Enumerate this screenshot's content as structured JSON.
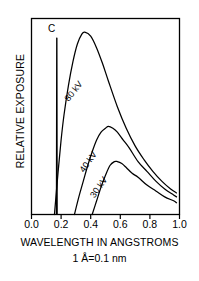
{
  "chart_data": {
    "type": "line",
    "title": "",
    "xlabel": "WAVELENGTH IN ANGSTROMS",
    "xsublabel": "1 Å=0.1 nm",
    "ylabel": "RELATIVE EXPOSURE",
    "xlim": [
      0.0,
      1.0
    ],
    "ylim": [
      0,
      100
    ],
    "grid": false,
    "legend_position": "inline-curve-labels",
    "xticks": [
      0.0,
      0.2,
      0.4,
      0.6,
      0.8,
      1.0
    ],
    "xticklabels": [
      "0.0",
      "0.2",
      "0.4",
      "0.6",
      "0.8",
      "1.0"
    ],
    "yticks": [],
    "yticklabels": [],
    "annotations": [
      {
        "name": "characteristic-line-label",
        "text": "C",
        "x": 0.17,
        "y": 93,
        "description": "Characteristic K-line spike of the tungsten/target material"
      }
    ],
    "series": [
      {
        "name": "80 kV",
        "label": "80 kV",
        "label_x": 0.3,
        "label_y": 62,
        "label_rotation": -52,
        "x": [
          0.155,
          0.18,
          0.2,
          0.22,
          0.25,
          0.28,
          0.31,
          0.34,
          0.36,
          0.4,
          0.44,
          0.48,
          0.52,
          0.58,
          0.64,
          0.7,
          0.76,
          0.82,
          0.88,
          0.94,
          0.98
        ],
        "y": [
          0,
          22,
          38,
          51,
          66,
          78,
          87,
          92,
          93,
          91,
          85,
          77,
          68,
          55,
          44,
          35,
          28,
          22,
          17,
          13,
          11
        ]
      },
      {
        "name": "40 kV",
        "label": "40 kV",
        "label_x": 0.4,
        "label_y": 26,
        "label_rotation": -55,
        "x": [
          0.29,
          0.32,
          0.35,
          0.38,
          0.41,
          0.44,
          0.47,
          0.5,
          0.52,
          0.55,
          0.58,
          0.62,
          0.66,
          0.72,
          0.78,
          0.84,
          0.9,
          0.96,
          0.98
        ],
        "y": [
          0,
          9,
          17,
          25,
          32,
          38,
          42,
          44,
          45,
          44,
          42,
          38,
          34,
          27,
          22,
          17,
          13,
          10,
          9
        ]
      },
      {
        "name": "30 kV",
        "label": "30 kV",
        "label_x": 0.47,
        "label_y": 13,
        "label_rotation": -55,
        "x": [
          0.41,
          0.44,
          0.47,
          0.5,
          0.53,
          0.56,
          0.58,
          0.61,
          0.64,
          0.68,
          0.72,
          0.78,
          0.84,
          0.9,
          0.96,
          0.98
        ],
        "y": [
          0,
          7,
          14,
          20,
          25,
          27,
          27,
          26,
          24,
          21,
          19,
          15,
          12,
          9,
          7,
          6
        ]
      },
      {
        "name": "characteristic-spike",
        "label": "C",
        "label_x": 0.17,
        "label_y": 93,
        "x": [
          0.168,
          0.17,
          0.172,
          0.174
        ],
        "y": [
          0,
          90,
          90,
          0
        ]
      }
    ],
    "colors": {
      "axis": "#000000",
      "curve": "#000000",
      "background": "#ffffff"
    }
  }
}
